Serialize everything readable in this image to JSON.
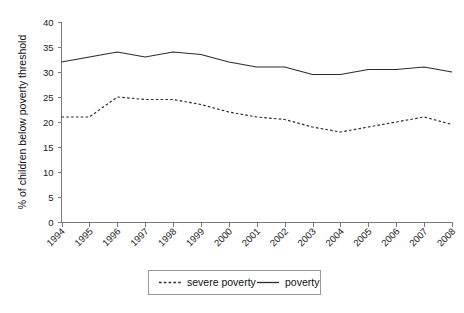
{
  "chart_data": {
    "type": "line",
    "title": "",
    "xlabel": "",
    "ylabel": "% of children below poverty threshold",
    "categories": [
      "1994",
      "1995",
      "1996",
      "1997",
      "1998",
      "1999",
      "2000",
      "2001",
      "2002",
      "2003",
      "2004",
      "2005",
      "2006",
      "2007",
      "2008"
    ],
    "x": [
      1994,
      1995,
      1996,
      1997,
      1998,
      1999,
      2000,
      2001,
      2002,
      2003,
      2004,
      2005,
      2006,
      2007,
      2008
    ],
    "ylim": [
      0,
      40
    ],
    "yticks": [
      0,
      5,
      10,
      15,
      20,
      25,
      30,
      35,
      40
    ],
    "ytick_labels": [
      "0",
      "5",
      "10",
      "15",
      "20",
      "25",
      "30",
      "35",
      "40"
    ],
    "grid": false,
    "legend_position": "bottom-center",
    "series": [
      {
        "name": "severe poverty",
        "style": "dashed",
        "color": "#2b2b2b",
        "values": [
          21,
          21,
          25,
          24.5,
          24.5,
          23.5,
          22,
          21,
          20.5,
          19,
          18,
          19,
          20,
          21,
          19.5
        ]
      },
      {
        "name": "poverty",
        "style": "solid",
        "color": "#2b2b2b",
        "values": [
          32,
          33,
          34,
          33,
          34,
          33.5,
          32,
          31,
          31,
          29.5,
          29.5,
          30.5,
          30.5,
          31,
          30
        ]
      }
    ]
  },
  "legend": {
    "entries": [
      {
        "label": "severe poverty",
        "style": "dashed"
      },
      {
        "label": "poverty",
        "style": "solid"
      }
    ]
  },
  "colors": {
    "axis": "#7a7a7a",
    "line": "#2b2b2b",
    "text": "#111111",
    "background": "#ffffff"
  }
}
